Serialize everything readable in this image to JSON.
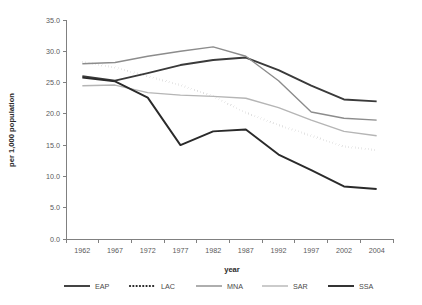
{
  "chart_data": {
    "type": "line",
    "title": "",
    "xlabel": "year",
    "ylabel": "per 1,000 population",
    "categories": [
      "1962",
      "1967",
      "1972",
      "1977",
      "1982",
      "1987",
      "1992",
      "1997",
      "2002",
      "2004"
    ],
    "x": [
      1962,
      1967,
      1972,
      1977,
      1982,
      1987,
      1992,
      1997,
      2002,
      2004
    ],
    "ylim": [
      0.0,
      35.0
    ],
    "ytick_values": [
      0.0,
      5.0,
      10.0,
      15.0,
      20.0,
      25.0,
      30.0,
      35.0
    ],
    "ytick_labels": [
      "0.0",
      "5.0",
      "10.0",
      "15.0",
      "20.0",
      "25.0",
      "30.0",
      "35.0"
    ],
    "grid": false,
    "legend_position": "bottom",
    "series": [
      {
        "name": "EAP",
        "color": "#3a3a3a",
        "style": "solid",
        "width": 1.9,
        "values": [
          26.0,
          25.3,
          26.5,
          27.8,
          28.6,
          29.0,
          27.0,
          24.5,
          22.3,
          22.0
        ]
      },
      {
        "name": "LAC",
        "color": "#1f1f1f",
        "style": "dotted",
        "width": 1.9,
        "values": [
          28.3,
          27.4,
          26.0,
          24.6,
          22.8,
          20.2,
          18.2,
          16.5,
          14.8,
          14.2
        ]
      },
      {
        "name": "MNA",
        "color": "#8c8c8c",
        "style": "solid",
        "width": 1.4,
        "values": [
          28.0,
          28.2,
          29.2,
          30.0,
          30.7,
          29.2,
          25.3,
          20.3,
          19.3,
          19.0
        ]
      },
      {
        "name": "SAR",
        "color": "#b5b5b5",
        "style": "solid",
        "width": 1.4,
        "values": [
          24.5,
          24.6,
          23.4,
          23.0,
          22.8,
          22.5,
          21.0,
          19.0,
          17.2,
          16.5
        ]
      },
      {
        "name": "SSA",
        "color": "#2a2a2a",
        "style": "solid",
        "width": 1.9,
        "values": [
          25.8,
          25.2,
          22.6,
          15.0,
          17.2,
          17.5,
          13.5,
          11.0,
          8.4,
          8.0
        ]
      }
    ]
  },
  "legend": {
    "items": [
      {
        "label": "EAP"
      },
      {
        "label": "LAC"
      },
      {
        "label": "MNA"
      },
      {
        "label": "SAR"
      },
      {
        "label": "SSA"
      }
    ]
  },
  "axes": {
    "x_title": "year",
    "y_title": "per 1,000 population"
  }
}
